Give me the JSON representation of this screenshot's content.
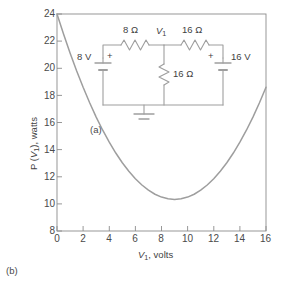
{
  "figure": {
    "panel_a_label": "(a)",
    "panel_b_label": "(b)"
  },
  "axes": {
    "xlabel_var": "V",
    "xlabel_sub": "1",
    "xlabel_rest": ", volts",
    "ylabel_pre": "P (",
    "ylabel_var": "V",
    "ylabel_sub": "1",
    "ylabel_rest": "), watts",
    "xticks": [
      "0",
      "2",
      "4",
      "6",
      "8",
      "10",
      "12",
      "14",
      "16"
    ],
    "yticks": [
      "8",
      "10",
      "12",
      "14",
      "16",
      "18",
      "20",
      "22",
      "24"
    ]
  },
  "circuit": {
    "source_left": "8 V",
    "source_left_polarity": "+",
    "source_right": "16 V",
    "source_right_polarity": "+",
    "resistor_top_left": "8 Ω",
    "resistor_top_right": "16 Ω",
    "resistor_middle": "16 Ω",
    "node_var": "V",
    "node_sub": "1",
    "ground": "ground-symbol"
  },
  "colors": {
    "curve": "#9a9a9a",
    "axis": "#8c8c8c",
    "text": "#3f3f3f",
    "background": "#ffffff",
    "wire": "#9e9e9e"
  },
  "chart_data": {
    "type": "line",
    "title": "",
    "xlabel": "V1, volts",
    "ylabel": "P (V1), watts",
    "xlim": [
      0,
      16
    ],
    "ylim": [
      8,
      24
    ],
    "grid": false,
    "legend": "none",
    "annotations": [
      "(a)",
      "(b)"
    ],
    "series": [
      {
        "name": "P(V1)",
        "x": [
          0,
          0.5,
          1,
          1.5,
          2,
          2.5,
          3,
          3.5,
          4,
          4.5,
          5,
          5.5,
          6,
          6.5,
          7,
          7.5,
          8,
          8.5,
          9,
          9.5,
          10,
          10.5,
          11,
          11.5,
          12,
          12.5,
          13,
          13.5,
          14,
          14.5,
          15,
          15.5,
          16
        ],
        "y": [
          24.0,
          22.52,
          21.13,
          19.82,
          18.6,
          17.46,
          16.4,
          15.43,
          14.55,
          13.75,
          13.03,
          12.4,
          11.85,
          11.39,
          11.01,
          10.71,
          10.5,
          10.38,
          10.33,
          10.38,
          10.5,
          10.71,
          11.01,
          11.39,
          11.85,
          12.4,
          13.03,
          13.75,
          14.55,
          15.43,
          16.4,
          17.46,
          18.6
        ]
      }
    ],
    "note": "Parabola with vertex near V1 = 8.2 V, P = 8.2 W; endpoints P(0) = 24 W and P(16) = 24 W"
  }
}
